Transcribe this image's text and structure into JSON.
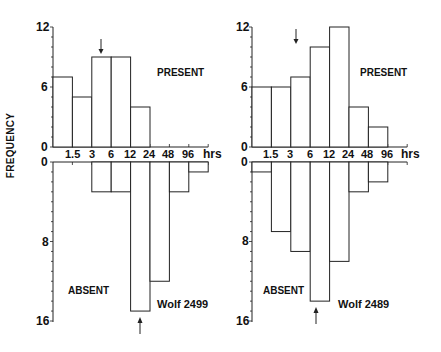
{
  "y_axis_label": "FREQUENCY",
  "chart_data": [
    {
      "type": "bar",
      "title": "Wolf 2499",
      "xlabel": "hrs",
      "ylabel": "FREQUENCY",
      "categories": [
        "0-1.5",
        "1.5-3",
        "3-6",
        "6-12",
        "12-24",
        "24-48",
        "48-96",
        ">96"
      ],
      "x_tick_labels": [
        "1.5",
        "3",
        "6",
        "12",
        "24",
        "48",
        "96",
        "hrs"
      ],
      "series": [
        {
          "name": "PRESENT",
          "values": [
            7,
            5,
            9,
            9,
            4,
            0,
            0,
            0
          ],
          "ylim": [
            0,
            12
          ],
          "y_ticks": [
            "0",
            "6",
            "12"
          ]
        },
        {
          "name": "ABSENT",
          "values": [
            0,
            0,
            3,
            3,
            15,
            12,
            3,
            1
          ],
          "ylim": [
            0,
            16
          ],
          "y_ticks": [
            "0",
            "8",
            "16"
          ],
          "inverted": true
        }
      ],
      "annotations": [
        {
          "type": "arrow-down",
          "label": "present median",
          "at": "3-6"
        },
        {
          "type": "arrow-up",
          "label": "absent median",
          "at": "12-24"
        }
      ],
      "grid": false
    },
    {
      "type": "bar",
      "title": "Wolf 2489",
      "xlabel": "hrs",
      "ylabel": "FREQUENCY",
      "categories": [
        "0-1.5",
        "1.5-3",
        "3-6",
        "6-12",
        "12-24",
        "24-48",
        "48-96",
        ">96"
      ],
      "x_tick_labels": [
        "1.5",
        "3",
        "6",
        "12",
        "24",
        "48",
        "96",
        "hrs"
      ],
      "series": [
        {
          "name": "PRESENT",
          "values": [
            6,
            6,
            7,
            10,
            12,
            4,
            2,
            0
          ],
          "ylim": [
            0,
            12
          ],
          "y_ticks": [
            "0",
            "6",
            "12"
          ]
        },
        {
          "name": "ABSENT",
          "values": [
            1,
            7,
            9,
            14,
            10,
            3,
            2,
            0
          ],
          "ylim": [
            0,
            16
          ],
          "y_ticks": [
            "0",
            "8",
            "16"
          ],
          "inverted": true
        }
      ],
      "annotations": [
        {
          "type": "arrow-down",
          "label": "present median",
          "at": "6-12"
        },
        {
          "type": "arrow-up",
          "label": "absent median",
          "at": "6-12"
        }
      ],
      "grid": false
    }
  ],
  "panels": [
    {
      "name": "Wolf 2499",
      "present_label": "PRESENT",
      "absent_label": "ABSENT",
      "y_top_ticks": [
        "12",
        "6",
        "0"
      ],
      "y_bottom_ticks": [
        "0",
        "8",
        "16"
      ],
      "x_ticks": [
        "1.5",
        "3",
        "6",
        "12",
        "24",
        "48",
        "96"
      ],
      "x_unit": "hrs"
    },
    {
      "name": "Wolf 2489",
      "present_label": "PRESENT",
      "absent_label": "ABSENT",
      "y_top_ticks": [
        "12",
        "6",
        "0"
      ],
      "y_bottom_ticks": [
        "0",
        "8",
        "16"
      ],
      "x_ticks": [
        "1.5",
        "3",
        "6",
        "12",
        "24",
        "48",
        "96"
      ],
      "x_unit": "hrs"
    }
  ]
}
